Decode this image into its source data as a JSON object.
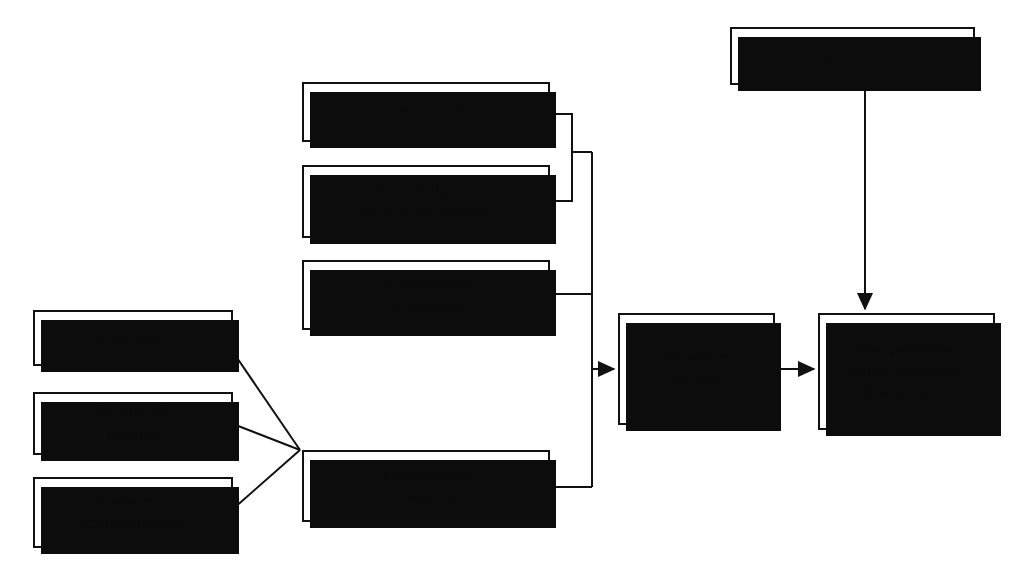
{
  "figure": {
    "kind": "flow-diagram",
    "title_text": "",
    "background_color": "#ffffff",
    "line_color": "#111111",
    "box_fill": "#ffffff",
    "shadow_color": "#0c0c0c"
  },
  "nodes": {
    "action_skills": {
      "label": "Action skills",
      "x": 302,
      "y": 82,
      "w": 248,
      "h": 60
    },
    "knowledge_action_strategies": {
      "label": "Knowledge of\naction strategies",
      "x": 302,
      "y": 165,
      "w": 248,
      "h": 73
    },
    "knowledge_of_issues": {
      "label": "Knowledge\nof issues",
      "x": 302,
      "y": 260,
      "w": 248,
      "h": 70
    },
    "personality_factors": {
      "label": "Personality\nfactors",
      "x": 302,
      "y": 450,
      "w": 248,
      "h": 72
    },
    "attitudes": {
      "label": "Attitudes",
      "x": 33,
      "y": 310,
      "w": 200,
      "h": 56
    },
    "locus_of_control": {
      "label": "Locus of\ncontrol",
      "x": 33,
      "y": 392,
      "w": 200,
      "h": 63
    },
    "personal_commitment": {
      "label": "Personal\ncommitment",
      "x": 33,
      "y": 477,
      "w": 200,
      "h": 71
    },
    "intention_to_act": {
      "label": "Intention\nto act",
      "x": 618,
      "y": 313,
      "w": 157,
      "h": 112
    },
    "context": {
      "label": "Context",
      "x": 730,
      "y": 27,
      "w": 245,
      "h": 58
    },
    "responsible_environmental_behaviour": {
      "label": "Responsible\nenvironmental\nbehaviour",
      "x": 818,
      "y": 313,
      "w": 177,
      "h": 117
    }
  },
  "connectors": [
    {
      "name": "action-skills-to-inner-bracket",
      "kind": "elbow"
    },
    {
      "name": "knowledge-action-strategies-to-inner-bracket",
      "kind": "elbow"
    },
    {
      "name": "inner-bracket-stub-to-outer-bracket",
      "kind": "stub"
    },
    {
      "name": "knowledge-of-issues-to-outer-bracket",
      "kind": "straight"
    },
    {
      "name": "personality-factors-to-outer-bracket",
      "kind": "elbow"
    },
    {
      "name": "outer-bracket-to-intention-to-act",
      "kind": "arrow"
    },
    {
      "name": "attitudes-to-personality-factors",
      "kind": "diagonal"
    },
    {
      "name": "locus-of-control-to-personality-factors",
      "kind": "diagonal"
    },
    {
      "name": "personal-commitment-to-personality-factors",
      "kind": "diagonal"
    },
    {
      "name": "intention-to-act-to-responsible-behaviour",
      "kind": "arrow"
    },
    {
      "name": "context-to-responsible-behaviour",
      "kind": "arrow"
    }
  ]
}
